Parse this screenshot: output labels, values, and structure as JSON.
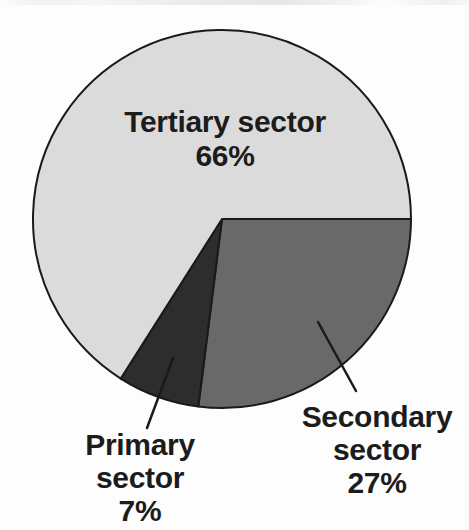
{
  "background_color": "#fdfdfd",
  "chart_data": {
    "type": "pie",
    "title": "",
    "start_angle_deg": 0,
    "direction": "clockwise",
    "total": 100,
    "outline_color": "#1a1a1a",
    "text_color": "#1c1c1c",
    "legend": "none",
    "slices": [
      {
        "name": "Secondary sector",
        "value": 27,
        "pct_label": "27%",
        "color": "#696969",
        "label_position": "outside-bottom-right"
      },
      {
        "name": "Primary sector",
        "value": 7,
        "pct_label": "7%",
        "color": "#2d2d2d",
        "label_position": "outside-bottom-left"
      },
      {
        "name": "Tertiary sector",
        "value": 66,
        "pct_label": "66%",
        "color": "#dbdbdb",
        "label_position": "inside-top"
      }
    ]
  }
}
